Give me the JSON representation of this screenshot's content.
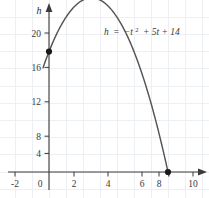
{
  "chart_data": {
    "type": "line",
    "title": "",
    "subtitle": "",
    "xlabel": "t",
    "ylabel": "h",
    "axis_labels": {
      "x": "t",
      "y": "h"
    },
    "equation": {
      "lhs": "h",
      "equals": "=",
      "term1": "−t",
      "exponent": "2",
      "rest": "+ 5t + 14",
      "plain": "h = −t² + 5t + 14"
    },
    "function": "h = -t^2 + 5t + 14",
    "xlim": [
      -3,
      11.5
    ],
    "ylim": [
      -3.2,
      22.5
    ],
    "xticks": [
      -2,
      0,
      2,
      4,
      6,
      8,
      10
    ],
    "xtick_labels": [
      "-2",
      "0",
      "2",
      "4",
      "6",
      "8",
      "10"
    ],
    "yticks": [
      0,
      4,
      8,
      12,
      16,
      20
    ],
    "ytick_labels": [
      "0",
      "4",
      "8",
      "12",
      "16",
      "20"
    ],
    "grid": true,
    "grid_step_x": 1,
    "grid_step_y": 2,
    "grid_color": "#eceff3",
    "legend": "none",
    "curve_color": "#555555",
    "axis_color": "#3a3a3a",
    "point_color": "#1a1a1a",
    "curve_domain": [
      -0.35,
      7.05
    ],
    "points": [
      {
        "label": "y-intercept",
        "x": 0,
        "y": 14,
        "marker": "filled-circle"
      },
      {
        "label": "x-intercept",
        "x": 7,
        "y": 0,
        "marker": "filled-circle"
      }
    ],
    "vertex": {
      "x": 2.5,
      "y": 20.25
    },
    "series": [
      {
        "name": "h = -t^2 + 5t + 14",
        "x": [
          -0.35,
          0,
          0.5,
          1,
          1.5,
          2,
          2.5,
          3,
          3.5,
          4,
          4.5,
          5,
          5.5,
          6,
          6.5,
          7
        ],
        "y": [
          12.1,
          14,
          16.25,
          18,
          19.25,
          20,
          20.25,
          20,
          19.25,
          18,
          16.25,
          14,
          11.25,
          8,
          4.25,
          0
        ]
      }
    ]
  }
}
